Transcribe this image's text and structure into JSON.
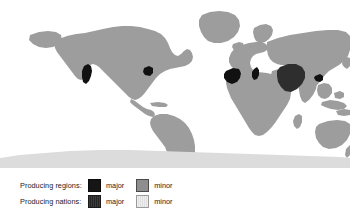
{
  "figure": {
    "type": "choropleth-world-map",
    "background_color": "#ffffff",
    "width": 350,
    "height": 221
  },
  "map": {
    "projection": "equirectangular",
    "ocean_color": "#ffffff",
    "land_base_color": "#9d9d9d",
    "antarctica_color": "#dcdcdc",
    "highlight_color": "#111111",
    "highlighted_areas": [
      "California (western United States)",
      "Northeastern United States / Great Lakes",
      "Iberian Peninsula (Spain / Portugal)",
      "Italy",
      "Iran",
      "Northern India / Pakistan border area"
    ]
  },
  "legend": {
    "rows": [
      {
        "title": "Producing regions:",
        "major_label": "major",
        "major_color": "#151515",
        "minor_label": "minor",
        "minor_color": "#8e8e8e"
      },
      {
        "title": "Producing nations:",
        "major_label": "major",
        "major_color": "#333333",
        "minor_label": "minor",
        "minor_color": "#e6e6e6"
      }
    ]
  }
}
